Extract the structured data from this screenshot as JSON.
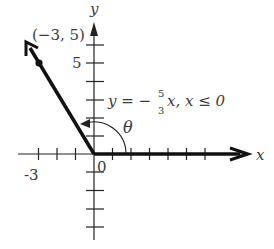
{
  "diagram": {
    "axes": {
      "x_label": "x",
      "y_label": "y",
      "origin_label": "0",
      "x_tick_label": "-3",
      "y_tick_label": "5"
    },
    "point": {
      "label": "(−3, 5)",
      "x": -3,
      "y": 5
    },
    "equation": {
      "lhs": "y = −",
      "frac_num": "5",
      "frac_den": "3",
      "rhs": "x, x ≤ 0"
    },
    "angle_label": "θ",
    "colors": {
      "ink": "#111111",
      "text": "#3a3a3a",
      "background": "#ffffff"
    }
  }
}
